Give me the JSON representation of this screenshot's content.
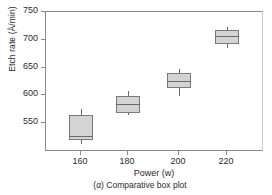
{
  "chart_data": {
    "type": "box",
    "title": "",
    "caption": "(α) Comparative box plot",
    "xlabel": "Power (w)",
    "ylabel": "Etch rate (Å/min)",
    "categories": [
      "160",
      "180",
      "200",
      "220"
    ],
    "xlim": [
      150,
      230
    ],
    "ylim": [
      513,
      750
    ],
    "yticks": [
      550,
      600,
      650,
      700,
      750
    ],
    "ytick_labels": [
      "550",
      "600",
      "650",
      "700",
      "750"
    ],
    "grid": false,
    "legend": null,
    "box_fill_color": "#d4d4d4",
    "box_line_color": "#7a7a7a",
    "axis_color": "#8a8a8a",
    "boxes": [
      {
        "category": "160",
        "whisker_low": 513,
        "q1": 520,
        "median": 527,
        "q3": 565,
        "whisker_high": 575
      },
      {
        "category": "180",
        "whisker_low": 565,
        "q1": 568,
        "median": 584,
        "q3": 598,
        "whisker_high": 608
      },
      {
        "category": "200",
        "whisker_low": 598,
        "q1": 613,
        "median": 626,
        "q3": 641,
        "whisker_high": 648
      },
      {
        "category": "220",
        "whisker_low": 686,
        "q1": 693,
        "median": 706,
        "q3": 717,
        "whisker_high": 723
      }
    ]
  }
}
